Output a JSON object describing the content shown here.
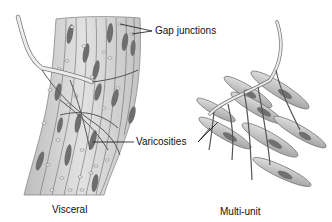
{
  "figure": {
    "labels": {
      "gap_junctions": "Gap junctions",
      "varicosities": "Varicosities",
      "visceral": "Visceral",
      "multi_unit": "Multi-unit"
    },
    "colors": {
      "background": "#ffffff",
      "tissue_fill": "#d6d6d6",
      "tissue_edge": "#8a8a8a",
      "nucleus": "#6e6e6e",
      "nerve_fill": "#ececec",
      "nerve_edge": "#7a7a7a",
      "fiber": "#555555",
      "cell_fill": "#cfcfcf",
      "cell_edge": "#707070",
      "label_text": "#111111",
      "leader_line": "#111111"
    }
  }
}
